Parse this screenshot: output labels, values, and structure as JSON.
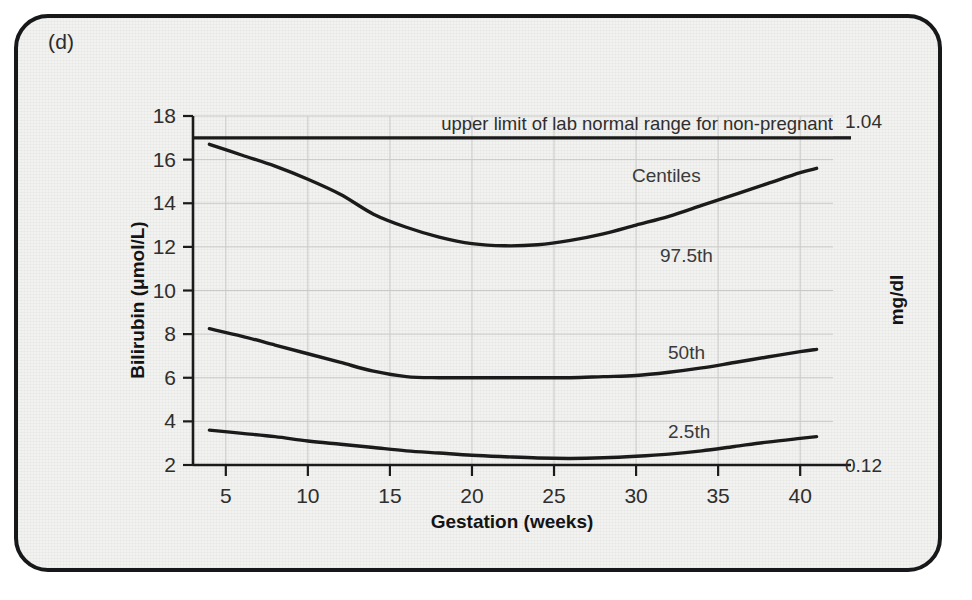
{
  "figure": {
    "panel_label": "(d)",
    "background_color": "#f2f2f0",
    "border_color": "#17181a"
  },
  "chart_data": {
    "type": "line",
    "title": "",
    "subtitle": "",
    "xlabel": "Gestation (weeks)",
    "ylabel": "Bilirubin (μmol/L)",
    "y2label": "mg/dl",
    "xlim": [
      3,
      42
    ],
    "ylim": [
      2,
      18
    ],
    "xticks": [
      5,
      10,
      15,
      20,
      25,
      30,
      35,
      40
    ],
    "xtick_labels": [
      "5",
      "10",
      "15",
      "20",
      "25",
      "30",
      "35",
      "40"
    ],
    "yticks": [
      2,
      4,
      6,
      8,
      10,
      12,
      14,
      16,
      18
    ],
    "ytick_labels": [
      "2",
      "4",
      "6",
      "8",
      "10",
      "12",
      "14",
      "16",
      "18"
    ],
    "y2_top_label": "1.04",
    "y2_bottom_label": "0.12",
    "y2_top_value": 17,
    "y2_bottom_value": 2,
    "grid": true,
    "grid_color": "#c9c9c9",
    "line_color": "#1b1b1b",
    "legend_position": "inline-annotations",
    "legend_title": "Centiles",
    "annotations": [
      {
        "name": "upper-limit-line",
        "text": "upper limit of lab normal range for non-pregnant",
        "y_value": 17,
        "type": "horizontal-reference-line"
      }
    ],
    "series": [
      {
        "name": "97.5th",
        "label": "97.5th",
        "x": [
          4,
          6,
          8,
          10,
          12,
          14,
          16,
          18,
          20,
          22,
          24,
          26,
          28,
          30,
          32,
          34,
          36,
          38,
          40,
          41
        ],
        "values": [
          16.7,
          16.2,
          15.7,
          15.1,
          14.4,
          13.5,
          12.9,
          12.45,
          12.15,
          12.05,
          12.1,
          12.3,
          12.6,
          13.0,
          13.4,
          13.9,
          14.4,
          14.9,
          15.4,
          15.6
        ]
      },
      {
        "name": "50th",
        "label": "50th",
        "x": [
          4,
          6,
          8,
          10,
          12,
          14,
          16,
          18,
          20,
          22,
          24,
          26,
          28,
          30,
          32,
          34,
          36,
          38,
          40,
          41
        ],
        "values": [
          8.25,
          7.9,
          7.5,
          7.1,
          6.7,
          6.3,
          6.05,
          6.0,
          6.0,
          6.0,
          6.0,
          6.0,
          6.05,
          6.1,
          6.25,
          6.45,
          6.7,
          6.95,
          7.2,
          7.3
        ]
      },
      {
        "name": "2.5th",
        "label": "2.5th",
        "x": [
          4,
          6,
          8,
          10,
          12,
          14,
          16,
          18,
          20,
          22,
          24,
          26,
          28,
          30,
          32,
          34,
          36,
          38,
          40,
          41
        ],
        "values": [
          3.6,
          3.45,
          3.3,
          3.1,
          2.95,
          2.8,
          2.65,
          2.55,
          2.45,
          2.38,
          2.32,
          2.3,
          2.33,
          2.4,
          2.5,
          2.65,
          2.85,
          3.05,
          3.22,
          3.3
        ]
      }
    ]
  }
}
